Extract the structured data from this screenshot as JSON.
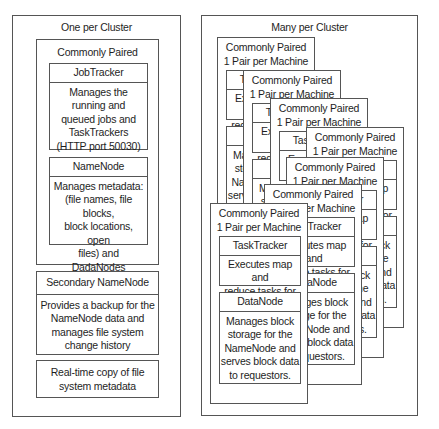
{
  "left_panel": {
    "title": "One per Cluster",
    "paired_group": {
      "title": "Commonly Paired",
      "jobtracker": {
        "title": "JobTracker",
        "lines": [
          "Manages the",
          "running and",
          "queued jobs and",
          "TaskTrackers",
          "(HTTP port 50030)"
        ]
      },
      "namenode": {
        "title": "NameNode",
        "lines": [
          "Manages metadata:",
          "(file names, file blocks,",
          "block locations, open",
          "files) and DadaNodes",
          "(HTTP port 50070)"
        ]
      }
    },
    "secondary_namenode": {
      "title": "Secondary NameNode",
      "lines": [
        "Provides a backup for the",
        "NameNode data and",
        "manages file system",
        "change history"
      ]
    },
    "realtime_copy": {
      "lines": [
        "Real-time copy of file",
        "system metadata"
      ]
    }
  },
  "right_panel": {
    "title": "Many per Cluster",
    "card": {
      "title_line1": "Commonly Paired",
      "title_line2": "1 Pair per Machine",
      "tasktracker": {
        "title": "TaskTracker",
        "lines": [
          "Executes map and",
          "reduce tasks for",
          "the TaskTracker."
        ]
      },
      "datanode": {
        "title": "DataNode",
        "lines": [
          "Manages block",
          "storage for the",
          "NameNode and",
          "serves block data",
          "to requestors."
        ]
      }
    },
    "card_count": 7
  }
}
